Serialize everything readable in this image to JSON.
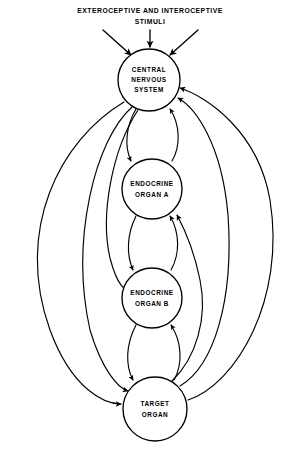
{
  "figure": {
    "title_lines": [
      "EXTEROCEPTIVE AND INTEROCEPTIVE",
      "STIMULI"
    ],
    "background_color": "#ffffff",
    "line_color": "#000000",
    "width": 301,
    "height": 450
  },
  "nodes": [
    {
      "id": "cns",
      "label_lines": [
        "CENTRAL",
        "NERVOUS",
        "SYSTEM"
      ],
      "line1": "CENTRAL",
      "line2": "NERVOUS",
      "line3": "SYSTEM",
      "cx": 149,
      "cy": 80,
      "r": 31
    },
    {
      "id": "endocrine-a",
      "label_lines": [
        "ENDOCRINE",
        "ORGAN A"
      ],
      "line1": "ENDOCRINE",
      "line2": "ORGAN A",
      "cx": 152,
      "cy": 189,
      "r": 30
    },
    {
      "id": "endocrine-b",
      "label_lines": [
        "ENDOCRINE",
        "ORGAN B"
      ],
      "line1": "ENDOCRINE",
      "line2": "ORGAN B",
      "cx": 152,
      "cy": 298,
      "r": 30
    },
    {
      "id": "target",
      "label_lines": [
        "TARGET",
        "ORGAN"
      ],
      "line1": "TARGET",
      "line2": "ORGAN",
      "cx": 155,
      "cy": 409,
      "r": 32
    }
  ],
  "stimulus_arrows": [
    {
      "id": "stimulus-arrow-left",
      "direction": "down-right"
    },
    {
      "id": "stimulus-arrow-center",
      "direction": "down"
    },
    {
      "id": "stimulus-arrow-right",
      "direction": "down-left"
    }
  ],
  "connections": {
    "descending_pairs": [
      {
        "from": "cns",
        "to": "endocrine-a"
      },
      {
        "from": "endocrine-a",
        "to": "endocrine-b"
      },
      {
        "from": "endocrine-b",
        "to": "target"
      }
    ],
    "ascending_pairs": [
      {
        "from": "endocrine-a",
        "to": "cns"
      },
      {
        "from": "endocrine-b",
        "to": "endocrine-a"
      },
      {
        "from": "target",
        "to": "endocrine-b"
      }
    ],
    "long_left_arcs": [
      {
        "from": "cns",
        "to": "target",
        "label": "outer bypass"
      },
      {
        "from": "cns",
        "to": "target",
        "label": "middle bypass"
      },
      {
        "from": "cns",
        "to": "endocrine-b",
        "label": "inner bypass"
      }
    ],
    "long_right_arcs": [
      {
        "from": "target",
        "to": "cns",
        "label": "outer feedback"
      },
      {
        "from": "target",
        "to": "cns",
        "label": "middle feedback"
      },
      {
        "from": "target",
        "to": "endocrine-a",
        "label": "inner feedback"
      }
    ]
  }
}
